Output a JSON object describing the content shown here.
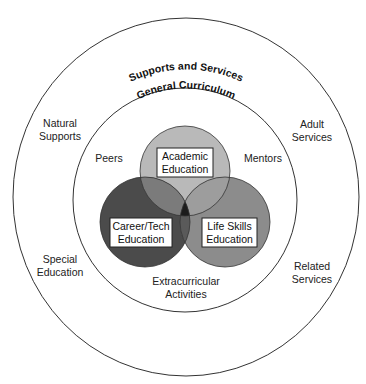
{
  "diagram": {
    "outer_ring": {
      "title": "Supports and Services",
      "items": {
        "natural_supports": [
          "Natural",
          "Supports"
        ],
        "adult_services": [
          "Adult",
          "Services"
        ],
        "special_education": [
          "Special",
          "Education"
        ],
        "related_services": [
          "Related",
          "Services"
        ]
      }
    },
    "inner_ring": {
      "title": "General Curriculum",
      "items": {
        "peers": "Peers",
        "mentors": "Mentors",
        "extracurricular": [
          "Extracurricular",
          "Activities"
        ]
      }
    },
    "venn": {
      "academic": {
        "lines": [
          "Academic",
          "Education"
        ],
        "color": "#b9b9b9"
      },
      "career_tech": {
        "lines": [
          "Career/Tech",
          "Education"
        ],
        "color": "#4b4b4b"
      },
      "life_skills": {
        "lines": [
          "Life Skills",
          "Education"
        ],
        "color": "#8c8c8c"
      }
    }
  }
}
